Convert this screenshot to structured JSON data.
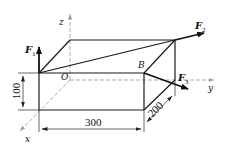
{
  "diagram": {
    "axes": {
      "x": "x",
      "y": "y",
      "z": "z"
    },
    "points": {
      "origin": "O",
      "corner": "B"
    },
    "forces": [
      {
        "name": "F",
        "sub": "1"
      },
      {
        "name": "F",
        "sub": "2"
      },
      {
        "name": "F",
        "sub": "3"
      }
    ],
    "dimensions": {
      "length": "300",
      "height": "100",
      "depth": "200"
    }
  }
}
